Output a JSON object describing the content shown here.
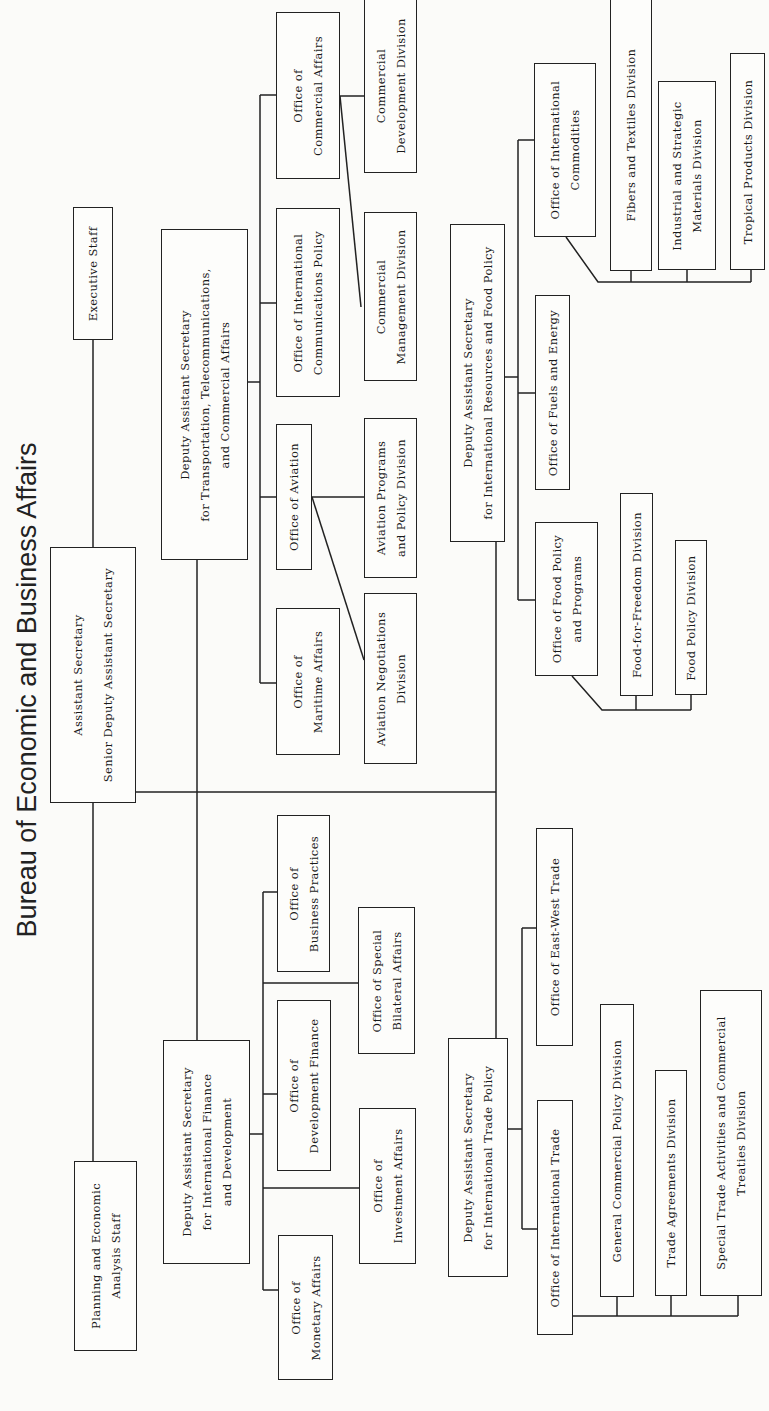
{
  "title": "Bureau of Economic and Business Affairs",
  "colors": {
    "line": "#222222",
    "background": "#fbfbf9",
    "box_fill": "#fdfdfb"
  },
  "top": {
    "executive_staff": [
      "Executive Staff"
    ],
    "assistant_secretary": [
      "Assistant Secretary",
      "Senior Deputy Assistant Secretary"
    ],
    "planning_staff": [
      "Planning and Economic",
      "Analysis Staff"
    ]
  },
  "transport": {
    "das": [
      "Deputy Assistant Secretary",
      "for Transportation, Telecommunications,",
      "and Commercial Affairs"
    ],
    "offices": {
      "maritime": [
        "Office of",
        "Maritime Affairs"
      ],
      "aviation": [
        "Office of Aviation"
      ],
      "communications": [
        "Office of International",
        "Communications Policy"
      ],
      "commercial": [
        "Office of",
        "Commercial Affairs"
      ]
    },
    "divisions": {
      "aviation_negotiations": [
        "Aviation Negotiations",
        "Division"
      ],
      "aviation_programs": [
        "Aviation Programs",
        "and Policy Division"
      ],
      "commercial_management": [
        "Commercial",
        "Management Division"
      ],
      "commercial_development": [
        "Commercial",
        "Development Division"
      ]
    }
  },
  "finance": {
    "das": [
      "Deputy Assistant Secretary",
      "for International Finance",
      "and Development"
    ],
    "offices": {
      "business_practices": [
        "Office of",
        "Business Practices"
      ],
      "development_finance": [
        "Office of",
        "Development Finance"
      ],
      "monetary": [
        "Office of",
        "Monetary Affairs"
      ],
      "special_bilateral": [
        "Office of Special",
        "Bilateral Affairs"
      ],
      "investment": [
        "Office of",
        "Investment Affairs"
      ]
    }
  },
  "resources": {
    "das": [
      "Deputy Assistant Secretary",
      "for International Resources and Food Policy"
    ],
    "offices": {
      "commodities": [
        "Office of International",
        "Commodities"
      ],
      "fuels": [
        "Office of Fuels and Energy"
      ],
      "food": [
        "Office of Food Policy",
        "and Programs"
      ]
    },
    "divisions": {
      "fibers": [
        "Fibers and Textiles Division"
      ],
      "industrial": [
        "Industrial and Strategic",
        "Materials Division"
      ],
      "tropical": [
        "Tropical Products Division"
      ],
      "food_for_freedom": [
        "Food-for-Freedom Division"
      ],
      "food_policy": [
        "Food Policy Division"
      ]
    }
  },
  "trade": {
    "das": [
      "Deputy Assistant Secretary",
      "for International Trade Policy"
    ],
    "offices": {
      "east_west": [
        "Office of East-West Trade"
      ],
      "international_trade": [
        "Office of International Trade"
      ]
    },
    "divisions": {
      "general_commercial": [
        "General Commercial Policy Division"
      ],
      "trade_agreements": [
        "Trade Agreements Division"
      ],
      "special_trade": [
        "Special Trade Activities and Commercial",
        "Treaties Division"
      ]
    }
  }
}
